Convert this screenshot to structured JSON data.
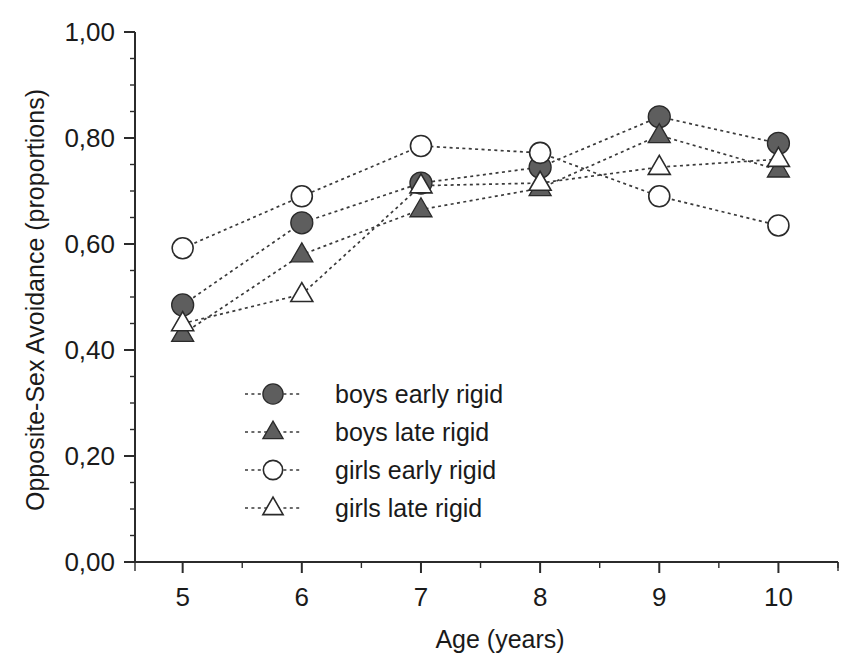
{
  "chart_data": {
    "type": "line",
    "title": "",
    "xlabel": "Age (years)",
    "ylabel": "Opposite-Sex Avoidance (proportions)",
    "x": [
      5,
      6,
      7,
      8,
      9,
      10
    ],
    "xtick_labels": [
      "5",
      "6",
      "7",
      "8",
      "9",
      "10"
    ],
    "ytick_labels": [
      "0,00",
      "0,20",
      "0,40",
      "0,60",
      "0,80",
      "1,00"
    ],
    "ytick_values": [
      0.0,
      0.2,
      0.4,
      0.6,
      0.8,
      1.0
    ],
    "xlim": [
      4.6,
      10.5
    ],
    "ylim": [
      0.0,
      1.0
    ],
    "grid": false,
    "legend_position": "inside-lower-left",
    "line_style": "dotted",
    "series": [
      {
        "name": "boys early rigid",
        "marker": "filled-circle",
        "color": "#5e5e5e",
        "values": [
          0.485,
          0.64,
          0.715,
          0.745,
          0.84,
          0.79
        ]
      },
      {
        "name": "boys late rigid",
        "marker": "filled-triangle",
        "color": "#5e5e5e",
        "values": [
          0.43,
          0.58,
          0.665,
          0.705,
          0.805,
          0.74
        ]
      },
      {
        "name": "girls early rigid",
        "marker": "open-circle",
        "color": "#ffffff",
        "values": [
          0.592,
          0.69,
          0.785,
          0.772,
          0.69,
          0.635
        ]
      },
      {
        "name": "girls late rigid",
        "marker": "open-triangle",
        "color": "#ffffff",
        "values": [
          0.45,
          0.505,
          0.71,
          0.715,
          0.745,
          0.76
        ]
      }
    ]
  },
  "legend": {
    "entries": [
      {
        "label": "boys early rigid",
        "marker": "filled-circle"
      },
      {
        "label": "boys late rigid",
        "marker": "filled-triangle"
      },
      {
        "label": "girls early rigid",
        "marker": "open-circle"
      },
      {
        "label": "girls late rigid",
        "marker": "open-triangle"
      }
    ]
  },
  "axes": {
    "x_title": "Age (years)",
    "y_title": "Opposite-Sex Avoidance (proportions)"
  }
}
